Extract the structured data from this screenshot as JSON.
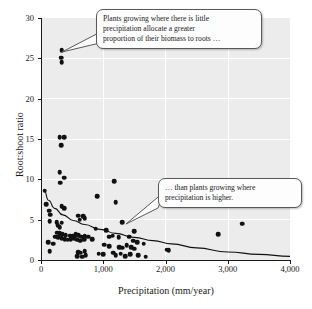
{
  "chart_data": {
    "type": "scatter",
    "title": "",
    "xlabel": "Precipitation (mm/year)",
    "ylabel": "Root:shoot ratio",
    "xlim": [
      0,
      4000
    ],
    "ylim": [
      0,
      30
    ],
    "xticks": [
      0,
      1000,
      2000,
      3000,
      4000
    ],
    "xticklabels": [
      "0",
      "1,000",
      "2,000",
      "3,000",
      "4,000"
    ],
    "yticks": [
      0,
      5,
      10,
      15,
      20,
      25,
      30
    ],
    "yticklabels": [
      "0",
      "5",
      "10",
      "15",
      "20",
      "25",
      "30"
    ],
    "grid": true,
    "legend": null,
    "marker_color": "#111111",
    "plot_background": "#ececec",
    "gridline_color": "#ffffff",
    "points": [
      [
        330,
        26.0
      ],
      [
        320,
        25.1
      ],
      [
        330,
        24.5
      ],
      [
        300,
        15.2
      ],
      [
        375,
        15.2
      ],
      [
        320,
        14.2
      ],
      [
        300,
        10.9
      ],
      [
        375,
        10.2
      ],
      [
        310,
        9.6
      ],
      [
        1180,
        9.8
      ],
      [
        60,
        8.6
      ],
      [
        900,
        7.9
      ],
      [
        1200,
        7.2
      ],
      [
        80,
        6.9
      ],
      [
        330,
        6.7
      ],
      [
        375,
        6.4
      ],
      [
        130,
        6.1
      ],
      [
        150,
        5.6
      ],
      [
        600,
        5.5
      ],
      [
        680,
        5.4
      ],
      [
        700,
        5.2
      ],
      [
        620,
        5.0
      ],
      [
        140,
        4.8
      ],
      [
        250,
        4.7
      ],
      [
        330,
        4.6
      ],
      [
        1300,
        4.7
      ],
      [
        3230,
        4.5
      ],
      [
        270,
        4.3
      ],
      [
        300,
        4.1
      ],
      [
        880,
        3.9
      ],
      [
        1050,
        3.7
      ],
      [
        1500,
        3.6
      ],
      [
        260,
        3.4
      ],
      [
        300,
        3.3
      ],
      [
        340,
        3.2
      ],
      [
        400,
        3.1
      ],
      [
        470,
        3.0
      ],
      [
        520,
        3.0
      ],
      [
        560,
        3.2
      ],
      [
        600,
        3.1
      ],
      [
        650,
        2.9
      ],
      [
        700,
        3.0
      ],
      [
        2850,
        3.2
      ],
      [
        230,
        2.9
      ],
      [
        280,
        2.8
      ],
      [
        330,
        2.7
      ],
      [
        380,
        2.6
      ],
      [
        430,
        2.5
      ],
      [
        480,
        2.6
      ],
      [
        530,
        2.7
      ],
      [
        580,
        2.5
      ],
      [
        630,
        2.4
      ],
      [
        690,
        2.6
      ],
      [
        760,
        2.9
      ],
      [
        820,
        2.6
      ],
      [
        1100,
        2.9
      ],
      [
        1150,
        3.0
      ],
      [
        1250,
        2.8
      ],
      [
        1420,
        2.9
      ],
      [
        1480,
        2.4
      ],
      [
        1550,
        2.2
      ],
      [
        1650,
        2.0
      ],
      [
        120,
        2.2
      ],
      [
        200,
        2.0
      ],
      [
        1020,
        1.9
      ],
      [
        1100,
        1.7
      ],
      [
        1260,
        1.6
      ],
      [
        1300,
        1.5
      ],
      [
        1380,
        1.8
      ],
      [
        1450,
        1.6
      ],
      [
        1500,
        1.4
      ],
      [
        2020,
        1.3
      ],
      [
        2050,
        1.2
      ],
      [
        140,
        1.1
      ],
      [
        600,
        1.0
      ],
      [
        640,
        0.9
      ],
      [
        700,
        1.1
      ],
      [
        930,
        0.8
      ],
      [
        1000,
        0.7
      ],
      [
        1160,
        0.9
      ],
      [
        1200,
        0.6
      ],
      [
        1280,
        0.8
      ],
      [
        1350,
        0.5
      ],
      [
        1430,
        0.7
      ],
      [
        1560,
        0.6
      ],
      [
        1680,
        0.4
      ],
      [
        580,
        0.5
      ],
      [
        660,
        0.4
      ],
      [
        720,
        0.6
      ]
    ],
    "trend": {
      "description": "decaying power curve fit through the scatter",
      "points": [
        [
          50,
          8.7
        ],
        [
          120,
          7.4
        ],
        [
          220,
          6.4
        ],
        [
          350,
          5.6
        ],
        [
          520,
          4.9
        ],
        [
          700,
          4.4
        ],
        [
          950,
          3.8
        ],
        [
          1200,
          3.3
        ],
        [
          1500,
          2.8
        ],
        [
          1800,
          2.4
        ],
        [
          2100,
          2.0
        ],
        [
          2500,
          1.5
        ],
        [
          3000,
          1.0
        ],
        [
          3500,
          0.7
        ],
        [
          4000,
          0.45
        ]
      ]
    },
    "annotations": [
      {
        "id": "callout-1",
        "lines": [
          "Plants growing where there is little",
          "precipitation allocate a greater",
          "proportion of their biomass to roots …"
        ],
        "points_to": [
          380,
          25.5
        ]
      },
      {
        "id": "callout-2",
        "lines": [
          "… than plants growing where",
          "precipitation is higher."
        ],
        "points_to": [
          850,
          5.3
        ]
      }
    ]
  }
}
